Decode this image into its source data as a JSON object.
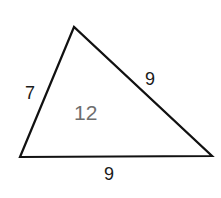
{
  "diagram": {
    "shape": "triangle",
    "vertices": [
      [
        74,
        27
      ],
      [
        20,
        157
      ],
      [
        212,
        156
      ]
    ],
    "stroke_color": "#111111",
    "side_labels": {
      "left": "7",
      "right": "9",
      "bottom": "9"
    },
    "area_label": "12",
    "area_label_color": "#6e6e6e"
  }
}
